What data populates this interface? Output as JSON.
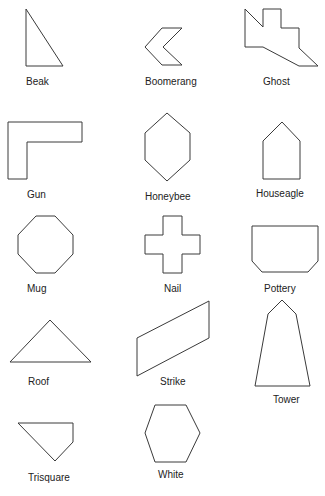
{
  "shapes": [
    {
      "label": "Beak",
      "points": "26,9 63,66 26,66",
      "label_x": 26,
      "label_y": 85,
      "anchor": "start"
    },
    {
      "label": "Boomerang",
      "points": "145,47 162,28 182,28 163,47 182,65 162,65",
      "label_x": 145,
      "label_y": 85,
      "anchor": "start"
    },
    {
      "label": "Ghost",
      "points": "245,9 263,27 263,9 281,9 281,28 299,28 299,48 318,66 299,66 263,47 245,47",
      "label_x": 263,
      "label_y": 85,
      "anchor": "start"
    },
    {
      "label": "Gun",
      "points": "8,122 82,122 82,142 27,142 27,179 8,179",
      "label_x": 27,
      "label_y": 198,
      "anchor": "start"
    },
    {
      "label": "Honeybee",
      "points": "167,113 190,133 190,160 167,181 145,160 145,133",
      "label_x": 145,
      "label_y": 200,
      "anchor": "start"
    },
    {
      "label": "Houseagle",
      "points": "282,122 300,141 300,179 263,179 263,141",
      "label_x": 256,
      "label_y": 197,
      "anchor": "start"
    },
    {
      "label": "Mug",
      "points": "36,216 55,216 73,235 73,254 55,273 36,273 18,254 18,235",
      "label_x": 27,
      "label_y": 292,
      "anchor": "start"
    },
    {
      "label": "Nail",
      "points": "163,216 182,216 182,235 200,235 200,254 182,254 182,273 163,273 163,254 145,254 145,235 163,235",
      "label_x": 164,
      "label_y": 292,
      "anchor": "start"
    },
    {
      "label": "Pottery",
      "points": "252,226 318,226 318,261 308,272 262,272 252,261",
      "label_x": 264,
      "label_y": 292,
      "anchor": "start"
    },
    {
      "label": "Roof",
      "points": "50,320 91,362 10,362",
      "label_x": 28,
      "label_y": 385,
      "anchor": "start"
    },
    {
      "label": "Strike",
      "points": "137,338 209,301 209,338 137,376",
      "label_x": 160,
      "label_y": 385,
      "anchor": "start"
    },
    {
      "label": "Tower",
      "points": "282,300 296,314 310,386 255,386 268,314",
      "label_x": 273,
      "label_y": 403,
      "anchor": "start"
    },
    {
      "label": "Trisquare",
      "points": "18,423 73,423 73,442 55,461 18,423",
      "label_x": 28,
      "label_y": 481,
      "anchor": "start"
    },
    {
      "label": "White",
      "points": "155,405 186,405 200,433 186,462 155,462 145,433",
      "label_x": 158,
      "label_y": 478,
      "anchor": "start"
    }
  ]
}
